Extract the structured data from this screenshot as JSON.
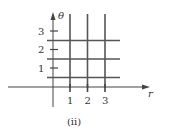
{
  "diagram": {
    "caption": "(ii)",
    "x_axis_label": "r",
    "y_axis_label": "θ",
    "x_ticks": [
      "1",
      "2",
      "3"
    ],
    "y_ticks": [
      "1",
      "2",
      "3"
    ],
    "grid": {
      "vertical_lines_at_r": [
        1,
        2,
        3
      ],
      "horizontal_lines_at_theta": [
        0.5,
        1.5,
        2.5
      ]
    },
    "line_color": "#444444"
  }
}
